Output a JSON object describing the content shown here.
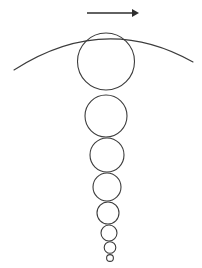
{
  "canvas": {
    "width": 202,
    "height": 268,
    "background": "#ffffff"
  },
  "style": {
    "stroke_color": "#3c3c3c",
    "arrow_color": "#2e2e2e",
    "circle_stroke_width": 1.1,
    "arc_stroke_width": 1.1,
    "arrow_stroke_width": 1.4
  },
  "figure": {
    "direction_arrow": {
      "label": "rightward-motion-arrow",
      "x1": 87,
      "y1": 13,
      "x2": 139,
      "y2": 13,
      "head_length": 7,
      "head_half_width": 4,
      "points": "right"
    },
    "arc": {
      "label": "surface-arc",
      "start_x": 14,
      "start_y": 70,
      "control_x": 104,
      "control_y": 12,
      "end_x": 193,
      "end_y": 62
    },
    "circles": [
      {
        "label": "circle-1",
        "cx": 106,
        "cy": 61.5,
        "r": 28.5
      },
      {
        "label": "circle-2",
        "cx": 106,
        "cy": 116,
        "r": 21
      },
      {
        "label": "circle-3",
        "cx": 107,
        "cy": 155,
        "r": 17
      },
      {
        "label": "circle-4",
        "cx": 107,
        "cy": 187,
        "r": 14
      },
      {
        "label": "circle-5",
        "cx": 108,
        "cy": 213,
        "r": 11
      },
      {
        "label": "circle-6",
        "cx": 109,
        "cy": 233,
        "r": 8
      },
      {
        "label": "circle-7",
        "cx": 110,
        "cy": 247.5,
        "r": 5.8
      },
      {
        "label": "circle-8",
        "cx": 110,
        "cy": 258,
        "r": 3.4
      }
    ]
  }
}
